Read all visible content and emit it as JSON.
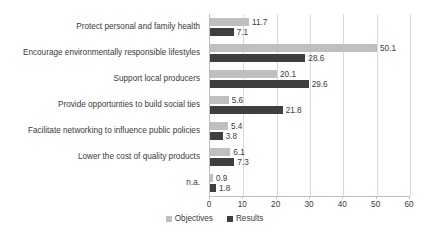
{
  "chart_data": {
    "type": "bar",
    "orientation": "horizontal",
    "title": "",
    "subtitle": "",
    "xlabel": "",
    "ylabel": "",
    "xlim": [
      0,
      60
    ],
    "xticks": [
      0,
      10,
      20,
      30,
      40,
      50,
      60
    ],
    "xtick_labels": [
      "0",
      "10",
      "20",
      "30",
      "40",
      "50",
      "60"
    ],
    "grid": true,
    "legend_position": "bottom",
    "categories": [
      "Protect personal and family health",
      "Encourage environmentally responsible lifestyles",
      "Support local producers",
      "Provide opportunties to build social ties",
      "Facilitate networking to influence public policies",
      "Lower the cost of quality products",
      "n.a."
    ],
    "series": [
      {
        "name": "Objectives",
        "color": "#bfbfbf",
        "values": [
          11.7,
          50.1,
          20.1,
          5.6,
          5.4,
          6.1,
          0.9
        ],
        "labels": [
          "11.7",
          "50.1",
          "20.1",
          "5.6",
          "5.4",
          "6.1",
          "0.9"
        ]
      },
      {
        "name": "Results",
        "color": "#3f3f3f",
        "values": [
          7.1,
          28.6,
          29.6,
          21.8,
          3.8,
          7.3,
          1.8
        ],
        "labels": [
          "7.1",
          "28.6",
          "29.6",
          "21.8",
          "3.8",
          "7.3",
          "1.8"
        ]
      }
    ]
  },
  "legend": {
    "items": [
      {
        "label": "Objectives",
        "color": "#bfbfbf"
      },
      {
        "label": "Results",
        "color": "#3f3f3f"
      }
    ]
  }
}
